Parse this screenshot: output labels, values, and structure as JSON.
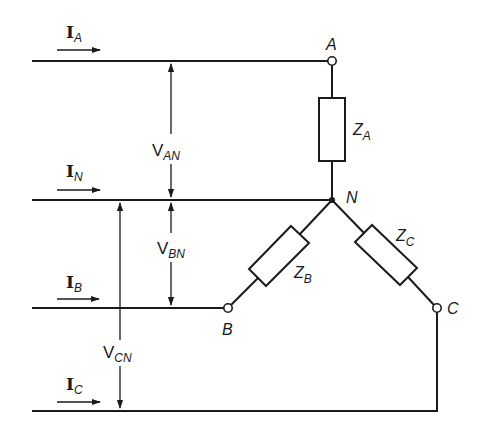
{
  "diagram": {
    "type": "three-phase wye-connected load (4-wire)",
    "currents": [
      {
        "id": "IA",
        "main": "I",
        "sub": "A"
      },
      {
        "id": "IN",
        "main": "I",
        "sub": "N"
      },
      {
        "id": "IB",
        "main": "I",
        "sub": "B"
      },
      {
        "id": "IC",
        "main": "I",
        "sub": "C"
      }
    ],
    "voltages": [
      {
        "id": "VAN",
        "main": "V",
        "sub": "AN"
      },
      {
        "id": "VBN",
        "main": "V",
        "sub": "BN"
      },
      {
        "id": "VCN",
        "main": "V",
        "sub": "CN"
      }
    ],
    "nodes": {
      "A": "A",
      "N": "N",
      "B": "B",
      "C": "C"
    },
    "impedances": [
      {
        "id": "ZA",
        "main": "Z",
        "sub": "A"
      },
      {
        "id": "ZB",
        "main": "Z",
        "sub": "B"
      },
      {
        "id": "ZC",
        "main": "Z",
        "sub": "C"
      }
    ],
    "colors": {
      "ink": "#1a1a1a",
      "background": "#ffffff"
    }
  }
}
